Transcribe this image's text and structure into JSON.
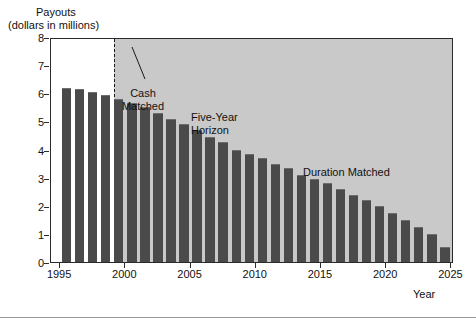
{
  "figure": {
    "background": "#ffffff",
    "plot_background_left": "#ffffff",
    "plot_background_right": "#c9c9c9",
    "bar_color": "#4a4a4a",
    "axis_color": "#2b2b2b"
  },
  "labels": {
    "y_axis_line1": "Payouts",
    "y_axis_line2": "(dollars in millions)",
    "x_axis": "Year",
    "cash_matched": "Cash\nMatched",
    "cash_matched_line1": "Cash",
    "cash_matched_line2": "Matched",
    "five_year_line1": "Five-Year",
    "five_year_line2": "Horizon",
    "duration_matched": "Duration Matched"
  },
  "chart_data": {
    "type": "bar",
    "title": "",
    "xlabel": "Year",
    "ylabel": "Payouts (dollars in millions)",
    "xlim": [
      1994.3,
      2025.2
    ],
    "ylim": [
      0,
      8
    ],
    "grid": false,
    "legend": false,
    "y_ticks": [
      0,
      1,
      2,
      3,
      4,
      5,
      6,
      7,
      8
    ],
    "y_tick_labels": [
      "0",
      "1",
      "2",
      "3",
      "4",
      "5",
      "6",
      "7",
      "8"
    ],
    "x_ticks": [
      1995,
      2000,
      2005,
      2010,
      2015,
      2020,
      2025
    ],
    "x_tick_labels": [
      "1995",
      "2000",
      "2005",
      "2010",
      "2015",
      "2020",
      "2025"
    ],
    "categories": [
      1995,
      1996,
      1997,
      1998,
      1999,
      2000,
      2001,
      2002,
      2003,
      2004,
      2005,
      2006,
      2007,
      2008,
      2009,
      2010,
      2011,
      2012,
      2013,
      2014,
      2015,
      2016,
      2017,
      2018,
      2019,
      2020,
      2021,
      2022,
      2023,
      2024
    ],
    "values": [
      6.2,
      6.15,
      6.05,
      5.95,
      5.8,
      5.65,
      5.5,
      5.3,
      5.1,
      4.9,
      4.7,
      4.45,
      4.25,
      4.0,
      3.85,
      3.7,
      3.5,
      3.35,
      3.1,
      2.95,
      2.8,
      2.6,
      2.4,
      2.2,
      2.0,
      1.75,
      1.5,
      1.25,
      1.0,
      0.55
    ],
    "annotations": [
      {
        "text": "Cash Matched",
        "region": "1995-1999",
        "shading": "none"
      },
      {
        "text": "Five-Year Horizon",
        "pointer_to_year": 1999
      },
      {
        "text": "Duration Matched",
        "region": "1999-2025",
        "shading": "gray"
      }
    ],
    "horizon_year": 1999.1
  }
}
